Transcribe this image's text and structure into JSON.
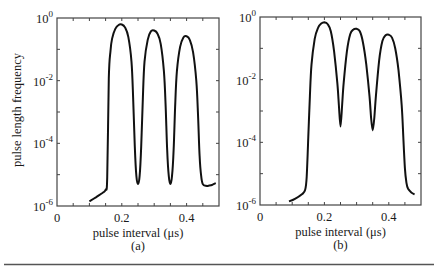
{
  "figure": {
    "ylabel": "pulse length frequency",
    "rule_color": "#555555"
  },
  "chart_data": [
    {
      "type": "line",
      "panel_label": "(a)",
      "title": "",
      "xlabel": "pulse interval (μs)",
      "ylabel": "pulse length frequency",
      "xlim": [
        0,
        0.5
      ],
      "ylim": [
        1e-06,
        1
      ],
      "yscale": "log",
      "xticks": [
        0,
        0.2,
        0.4
      ],
      "xtick_labels": [
        "0",
        "0.2",
        "0.4"
      ],
      "yticks": [
        1e-06,
        0.0001,
        0.01,
        1
      ],
      "ytick_labels": [
        {
          "base": "10",
          "exp": "-6"
        },
        {
          "base": "10",
          "exp": "-4"
        },
        {
          "base": "10",
          "exp": "-2"
        },
        {
          "base": "10",
          "exp": "0"
        }
      ],
      "grid": false,
      "line_color": "#111111",
      "series": [
        {
          "name": "a",
          "x": [
            0.1,
            0.12,
            0.14,
            0.15,
            0.155,
            0.16,
            0.165,
            0.17,
            0.18,
            0.19,
            0.2,
            0.21,
            0.22,
            0.23,
            0.235,
            0.24,
            0.245,
            0.25,
            0.255,
            0.26,
            0.265,
            0.27,
            0.28,
            0.29,
            0.3,
            0.31,
            0.32,
            0.33,
            0.335,
            0.34,
            0.345,
            0.35,
            0.355,
            0.36,
            0.365,
            0.37,
            0.38,
            0.39,
            0.4,
            0.41,
            0.42,
            0.43,
            0.435,
            0.44,
            0.445,
            0.45,
            0.46,
            0.47,
            0.48,
            0.49
          ],
          "y": [
            1.4e-06,
            1.9e-06,
            2.6e-06,
            3.3e-06,
            8e-06,
            0.012,
            0.09,
            0.22,
            0.45,
            0.6,
            0.62,
            0.5,
            0.25,
            0.04,
            0.003,
            8e-05,
            9e-06,
            5e-06,
            9e-06,
            8e-05,
            0.003,
            0.04,
            0.2,
            0.38,
            0.4,
            0.32,
            0.15,
            0.02,
            0.002,
            6e-05,
            9e-06,
            5e-06,
            9e-06,
            6e-05,
            0.002,
            0.02,
            0.12,
            0.24,
            0.26,
            0.2,
            0.08,
            0.01,
            0.001,
            4e-05,
            9e-06,
            5e-06,
            4.4e-06,
            4.5e-06,
            4.8e-06,
            5.4e-06
          ]
        }
      ]
    },
    {
      "type": "line",
      "panel_label": "(b)",
      "title": "",
      "xlabel": "pulse interval (μs)",
      "ylabel": "",
      "xlim": [
        0,
        0.5
      ],
      "ylim": [
        1e-06,
        1
      ],
      "yscale": "log",
      "xticks": [
        0,
        0.2,
        0.4
      ],
      "xtick_labels": [
        "0",
        "0.2",
        "0.4"
      ],
      "yticks": [
        1e-06,
        0.0001,
        0.01,
        1
      ],
      "ytick_labels": [
        {
          "base": "10",
          "exp": "-6"
        },
        {
          "base": "10",
          "exp": "-4"
        },
        {
          "base": "10",
          "exp": "-2"
        },
        {
          "base": "10",
          "exp": "0"
        }
      ],
      "grid": false,
      "line_color": "#111111",
      "series": [
        {
          "name": "b",
          "x": [
            0.09,
            0.11,
            0.13,
            0.14,
            0.145,
            0.15,
            0.155,
            0.16,
            0.17,
            0.18,
            0.19,
            0.2,
            0.21,
            0.22,
            0.23,
            0.24,
            0.245,
            0.25,
            0.255,
            0.26,
            0.27,
            0.28,
            0.29,
            0.3,
            0.31,
            0.32,
            0.33,
            0.34,
            0.345,
            0.35,
            0.355,
            0.36,
            0.37,
            0.38,
            0.39,
            0.4,
            0.41,
            0.42,
            0.43,
            0.44,
            0.445,
            0.45,
            0.455,
            0.46,
            0.47,
            0.48
          ],
          "y": [
            1.3e-06,
            1.6e-06,
            2.2e-06,
            3e-06,
            8e-06,
            0.00015,
            0.003,
            0.03,
            0.2,
            0.45,
            0.62,
            0.68,
            0.6,
            0.35,
            0.08,
            0.008,
            0.0015,
            0.00032,
            0.0015,
            0.008,
            0.08,
            0.28,
            0.4,
            0.42,
            0.35,
            0.15,
            0.03,
            0.003,
            0.0006,
            0.00024,
            0.0006,
            0.003,
            0.04,
            0.17,
            0.26,
            0.27,
            0.22,
            0.1,
            0.02,
            0.0015,
            0.00015,
            1.5e-05,
            5e-06,
            3.3e-06,
            2.5e-06,
            2.2e-06
          ]
        }
      ]
    }
  ]
}
